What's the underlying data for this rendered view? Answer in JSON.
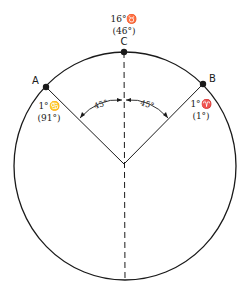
{
  "diagram": {
    "type": "zodiac-circle-angles",
    "points": [
      {
        "id": "A",
        "label": "A",
        "sign_text": "1°♋",
        "degree_text": "(91°)"
      },
      {
        "id": "B",
        "label": "B",
        "sign_text": "1°♈",
        "degree_text": "(1°)"
      },
      {
        "id": "C",
        "label": "C",
        "sign_text": "16°♉",
        "degree_text": "(46°)"
      }
    ],
    "angles": [
      {
        "between": [
          "A",
          "C"
        ],
        "label": "45°"
      },
      {
        "between": [
          "C",
          "B"
        ],
        "label": "45°"
      }
    ],
    "colors": {
      "stroke": "#1a1a1a",
      "background": "#ffffff"
    }
  }
}
